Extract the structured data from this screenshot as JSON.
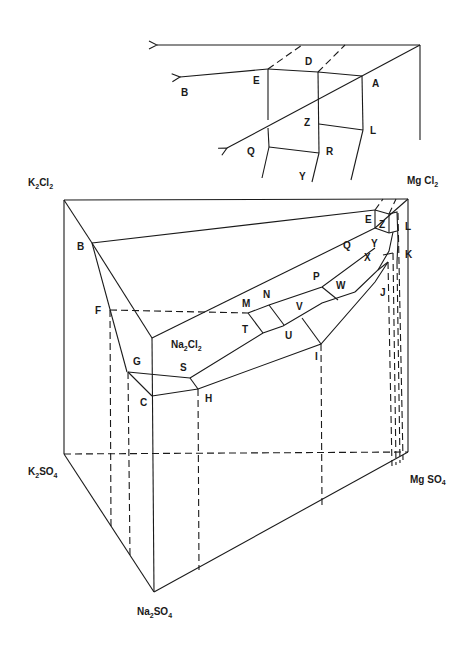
{
  "diagram": {
    "type": "phase-diagram-prism",
    "inset": {
      "labels": {
        "A": "A",
        "B": "B",
        "D": "D",
        "E": "E",
        "Z": "Z",
        "L": "L",
        "Q": "Q",
        "R": "R",
        "Y": "Y"
      }
    },
    "corners": {
      "k2cl2": {
        "base": "K",
        "sub1": "2",
        "mid": "Cl",
        "sub2": "2"
      },
      "mgcl2": {
        "base": "Mg Cl",
        "sub": "2"
      },
      "na2cl2": {
        "base": "Na",
        "sub1": "2",
        "mid": "Cl",
        "sub2": "2"
      },
      "k2so4": {
        "base": "K",
        "sub1": "2",
        "mid": "SO",
        "sub2": "4"
      },
      "mgso4": {
        "base": "Mg SO",
        "sub": "4"
      },
      "na2so4": {
        "base": "Na",
        "sub1": "2",
        "mid": "SO",
        "sub2": "4"
      }
    },
    "points": {
      "B": "B",
      "C": "C",
      "E": "E",
      "F": "F",
      "G": "G",
      "H": "H",
      "I": "I",
      "J": "J",
      "K": "K",
      "L": "L",
      "M": "M",
      "N": "N",
      "P": "P",
      "Q": "Q",
      "S": "S",
      "T": "T",
      "U": "U",
      "V": "V",
      "W": "W",
      "X": "X",
      "Y": "Y",
      "Z": "Z"
    }
  }
}
